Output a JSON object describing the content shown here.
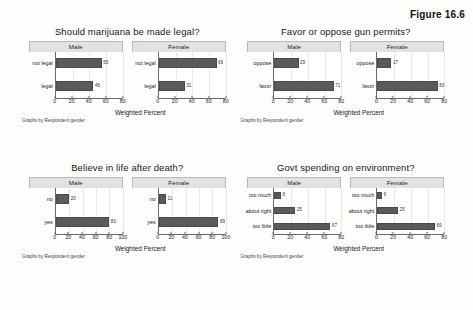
{
  "figure": {
    "caption": "Figure 16.6"
  },
  "common": {
    "axis_title": "Weighted Percent",
    "footnote": "Graphs by Respondent gender",
    "panel_male": "Male",
    "panel_female": "Female",
    "bar_color": "#5a5a5a",
    "panel_header_color": "#e2e2e2"
  },
  "chart_data": [
    {
      "type": "bar",
      "orientation": "horizontal",
      "title": "Should marijuana be made legal?",
      "xlabel": "Weighted Percent",
      "ylabel": "",
      "footnote": "Graphs by Respondent gender",
      "xlim": [
        0,
        80
      ],
      "xticks": [
        0,
        20,
        40,
        60,
        80
      ],
      "grid": true,
      "panels": [
        {
          "name": "Male",
          "categories": [
            "not legal",
            "legal"
          ],
          "values": [
            55,
            45
          ]
        },
        {
          "name": "Female",
          "categories": [
            "not legal",
            "legal"
          ],
          "values": [
            69,
            31
          ]
        }
      ]
    },
    {
      "type": "bar",
      "orientation": "horizontal",
      "title": "Favor or oppose gun permits?",
      "xlabel": "Weighted Percent",
      "ylabel": "",
      "footnote": "Graphs by Respondent gender",
      "xlim": [
        0,
        80
      ],
      "xticks": [
        0,
        20,
        40,
        60,
        80
      ],
      "grid": true,
      "panels": [
        {
          "name": "Male",
          "categories": [
            "oppose",
            "favor"
          ],
          "values": [
            29,
            71
          ]
        },
        {
          "name": "Female",
          "categories": [
            "oppose",
            "favor"
          ],
          "values": [
            17,
            83
          ]
        }
      ]
    },
    {
      "type": "bar",
      "orientation": "horizontal",
      "title": "Believe in life after death?",
      "xlabel": "Weighted Percent",
      "ylabel": "",
      "footnote": "Graphs by Respondent gender",
      "xlim": [
        0,
        100
      ],
      "xticks": [
        0,
        20,
        40,
        60,
        80,
        100
      ],
      "grid": true,
      "panels": [
        {
          "name": "Male",
          "categories": [
            "no",
            "yes"
          ],
          "values": [
            20,
            80
          ]
        },
        {
          "name": "Female",
          "categories": [
            "no",
            "yes"
          ],
          "values": [
            11,
            89
          ]
        }
      ]
    },
    {
      "type": "bar",
      "orientation": "horizontal",
      "title": "Govt spending on environment?",
      "xlabel": "Weighted Percent",
      "ylabel": "",
      "footnote": "Graphs by Respondent gender",
      "xlim": [
        0,
        80
      ],
      "xticks": [
        0,
        20,
        40,
        60,
        80
      ],
      "grid": true,
      "panels": [
        {
          "name": "Male",
          "categories": [
            "too much",
            "about right",
            "too little"
          ],
          "values": [
            8,
            25,
            67
          ]
        },
        {
          "name": "Female",
          "categories": [
            "too much",
            "about right",
            "too little"
          ],
          "values": [
            6,
            25,
            69
          ]
        }
      ]
    }
  ]
}
